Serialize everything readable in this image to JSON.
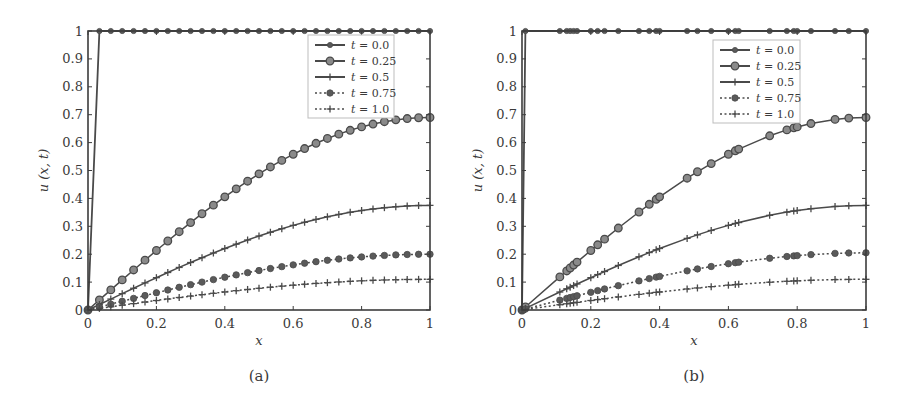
{
  "colors": {
    "line": "#4a4a4a",
    "axis": "#3c3c3c",
    "legend_border": "#bdbdbd",
    "marker_fill": "#5a5a5a"
  },
  "chart_data": [
    {
      "type": "line",
      "panel": "(a)",
      "caption": "(a)",
      "xlabel": "x",
      "ylabel": "u (x, t)",
      "xlim": [
        0,
        1
      ],
      "ylim": [
        0,
        1
      ],
      "xticks": [
        "0",
        "0.2",
        "0.4",
        "0.6",
        "0.8",
        "1"
      ],
      "yticks": [
        "0",
        "0.1",
        "0.2",
        "0.3",
        "0.4",
        "0.5",
        "0.6",
        "0.7",
        "0.8",
        "0.9",
        "1"
      ],
      "grid": false,
      "legend_position": "upper right",
      "x_points": "31 uniformly spaced points from 0 to 1",
      "series": [
        {
          "name": "t = 0.0",
          "label_t": "t",
          "label_v": " = 0.0",
          "style": "solid",
          "marker": "dot",
          "amplitude": 1.0,
          "profile": "step: 0 at x=0, 1 for x>=0.033"
        },
        {
          "name": "t = 0.25",
          "label_t": "t",
          "label_v": " = 0.25",
          "style": "solid",
          "marker": "circle",
          "amplitude": 0.69,
          "profile": "0.69*sin(pi*x/2)"
        },
        {
          "name": "t = 0.5",
          "label_t": "t",
          "label_v": " = 0.5",
          "style": "solid",
          "marker": "plus",
          "amplitude": 0.375,
          "profile": "0.375*sin(pi*x/2)"
        },
        {
          "name": "t = 0.75",
          "label_t": "t",
          "label_v": " = 0.75",
          "style": "dotted",
          "marker": "filled-circle",
          "amplitude": 0.2,
          "profile": "0.20*sin(pi*x/2)"
        },
        {
          "name": "t = 1.0",
          "label_t": "t",
          "label_v": " = 1.0",
          "style": "dotted",
          "marker": "plus",
          "amplitude": 0.11,
          "profile": "0.11*sin(pi*x/2)"
        }
      ],
      "sample_values": {
        "x": [
          0,
          0.2,
          0.4,
          0.6,
          0.8,
          1.0
        ],
        "t = 0.0": [
          0,
          1,
          1,
          1,
          1,
          1
        ],
        "t = 0.25": [
          0,
          0.21,
          0.41,
          0.56,
          0.66,
          0.69
        ],
        "t = 0.5": [
          0,
          0.12,
          0.22,
          0.3,
          0.36,
          0.375
        ],
        "t = 0.75": [
          0,
          0.06,
          0.12,
          0.16,
          0.19,
          0.2
        ],
        "t = 1.0": [
          0,
          0.03,
          0.06,
          0.09,
          0.1,
          0.11
        ]
      }
    },
    {
      "type": "line",
      "panel": "(b)",
      "caption": "(b)",
      "xlabel": "x",
      "ylabel": "u (x, t)",
      "xlim": [
        0,
        1
      ],
      "ylim": [
        0,
        1
      ],
      "xticks": [
        "0",
        "0.2",
        "0.4",
        "0.6",
        "0.8",
        "1"
      ],
      "yticks": [
        "0",
        "0.1",
        "0.2",
        "0.3",
        "0.4",
        "0.5",
        "0.6",
        "0.7",
        "0.8",
        "0.9",
        "1"
      ],
      "grid": false,
      "legend_position": "upper right",
      "x_points": [
        0,
        0.01,
        0.11,
        0.13,
        0.14,
        0.15,
        0.16,
        0.2,
        0.22,
        0.24,
        0.28,
        0.34,
        0.37,
        0.39,
        0.4,
        0.48,
        0.51,
        0.55,
        0.6,
        0.62,
        0.63,
        0.72,
        0.77,
        0.79,
        0.8,
        0.84,
        0.91,
        0.95,
        1.0
      ],
      "series": [
        {
          "name": "t = 0.0",
          "label_t": "t",
          "label_v": " = 0.0",
          "style": "solid",
          "marker": "dot",
          "amplitude": 1.0,
          "profile": "step: 0 at x=0, 1 for x>=0.01"
        },
        {
          "name": "t = 0.25",
          "label_t": "t",
          "label_v": " = 0.25",
          "style": "solid",
          "marker": "circle",
          "amplitude": 0.69,
          "profile": "0.69*sin(pi*x/2)"
        },
        {
          "name": "t = 0.5",
          "label_t": "t",
          "label_v": " = 0.5",
          "style": "solid",
          "marker": "plus",
          "amplitude": 0.375,
          "profile": "0.375*sin(pi*x/2)"
        },
        {
          "name": "t = 0.75",
          "label_t": "t",
          "label_v": " = 0.75",
          "style": "dotted",
          "marker": "filled-circle",
          "amplitude": 0.205,
          "profile": "0.205*sin(pi*x/2)"
        },
        {
          "name": "t = 1.0",
          "label_t": "t",
          "label_v": " = 1.0",
          "style": "dotted",
          "marker": "plus",
          "amplitude": 0.11,
          "profile": "0.11*sin(pi*x/2)"
        }
      ],
      "sample_values": {
        "x": [
          0,
          0.2,
          0.4,
          0.6,
          0.8,
          1.0
        ],
        "t = 0.0": [
          0,
          1,
          1,
          1,
          1,
          1
        ],
        "t = 0.25": [
          0,
          0.21,
          0.41,
          0.56,
          0.66,
          0.69
        ],
        "t = 0.5": [
          0,
          0.12,
          0.22,
          0.3,
          0.36,
          0.375
        ],
        "t = 0.75": [
          0,
          0.065,
          0.12,
          0.165,
          0.195,
          0.205
        ],
        "t = 1.0": [
          0,
          0.03,
          0.06,
          0.09,
          0.1,
          0.11
        ]
      }
    }
  ],
  "layout": {
    "panels": [
      {
        "left": 88,
        "right": 430,
        "top": 31,
        "bottom": 310,
        "legend": {
          "x": 308,
          "y": 35,
          "w": 86,
          "h": 83
        }
      },
      {
        "left": 522,
        "right": 866,
        "top": 31,
        "bottom": 310,
        "legend": {
          "x": 713,
          "y": 40,
          "w": 87,
          "h": 83
        }
      }
    ]
  }
}
